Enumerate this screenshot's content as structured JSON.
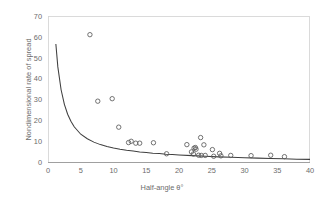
{
  "chart_data": {
    "type": "scatter",
    "title": "",
    "xlabel": "Half-angle θ°",
    "ylabel": "Nondimensional rate of spread",
    "xlim": [
      0,
      40
    ],
    "ylim": [
      0,
      70
    ],
    "xticks": [
      0,
      5,
      10,
      15,
      20,
      25,
      30,
      35,
      40
    ],
    "yticks": [
      0,
      10,
      20,
      30,
      40,
      50,
      60,
      70
    ],
    "grid": false,
    "legend": "none",
    "marker_style": "open-circle",
    "series": [
      {
        "name": "Measured data",
        "type": "scatter",
        "points": [
          [
            6.4,
            61.5
          ],
          [
            7.6,
            29.5
          ],
          [
            9.8,
            30.7
          ],
          [
            10.8,
            17.0
          ],
          [
            12.3,
            9.6
          ],
          [
            12.7,
            10.2
          ],
          [
            13.4,
            9.3
          ],
          [
            14.0,
            9.3
          ],
          [
            16.1,
            9.5
          ],
          [
            18.1,
            4.2
          ],
          [
            21.2,
            8.6
          ],
          [
            21.9,
            5.1
          ],
          [
            22.2,
            4.1
          ],
          [
            22.3,
            6.9
          ],
          [
            22.5,
            7.2
          ],
          [
            22.6,
            6.4
          ],
          [
            23.0,
            3.5
          ],
          [
            23.3,
            12.0
          ],
          [
            23.4,
            3.4
          ],
          [
            23.8,
            8.5
          ],
          [
            24.0,
            3.4
          ],
          [
            25.1,
            6.2
          ],
          [
            25.3,
            3.0
          ],
          [
            26.2,
            4.4
          ],
          [
            26.4,
            3.2
          ],
          [
            27.9,
            3.4
          ],
          [
            31.0,
            3.3
          ],
          [
            34.0,
            3.5
          ],
          [
            36.1,
            2.8
          ]
        ]
      },
      {
        "name": "Fitted curve",
        "type": "line",
        "points": [
          [
            1.2,
            57.0
          ],
          [
            1.5,
            46.0
          ],
          [
            2.0,
            35.0
          ],
          [
            2.5,
            28.0
          ],
          [
            3.0,
            23.2
          ],
          [
            3.5,
            19.8
          ],
          [
            4.0,
            17.2
          ],
          [
            5.0,
            13.6
          ],
          [
            6.0,
            11.4
          ],
          [
            7.0,
            9.8
          ],
          [
            8.0,
            8.6
          ],
          [
            9.0,
            7.7
          ],
          [
            10.0,
            7.0
          ],
          [
            11.0,
            6.4
          ],
          [
            12.0,
            5.9
          ],
          [
            13.0,
            5.5
          ],
          [
            14.0,
            5.1
          ],
          [
            15.0,
            4.8
          ],
          [
            16.0,
            4.5
          ],
          [
            17.0,
            4.3
          ],
          [
            18.0,
            4.0
          ],
          [
            19.0,
            3.8
          ],
          [
            20.0,
            3.6
          ],
          [
            22.0,
            3.3
          ],
          [
            24.0,
            3.0
          ],
          [
            26.0,
            2.7
          ],
          [
            28.0,
            2.5
          ],
          [
            30.0,
            2.3
          ],
          [
            32.0,
            2.1
          ],
          [
            34.0,
            1.9
          ],
          [
            36.0,
            1.8
          ],
          [
            38.0,
            1.6
          ],
          [
            40.0,
            1.5
          ]
        ]
      }
    ]
  },
  "colors": {
    "marker_stroke": "#5a5a5a",
    "line_stroke": "#3f3f3f",
    "frame": "#d4d4d4",
    "axis": "#9a9a9a",
    "tick_text": "#6b6b6b",
    "background": "#ffffff"
  }
}
